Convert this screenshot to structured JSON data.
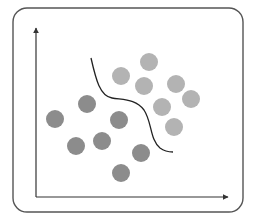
{
  "diagram": {
    "type": "classification-scatter-with-decision-boundary",
    "frame": {
      "x": 13,
      "y": 8,
      "width": 230,
      "height": 204,
      "radius": 14,
      "stroke": "#555555"
    },
    "axes": {
      "origin": {
        "x": 36,
        "y": 197
      },
      "y_axis_top": {
        "x": 36,
        "y": 28
      },
      "x_axis_right": {
        "x": 228,
        "y": 197
      },
      "color": "#333333"
    },
    "classes": [
      {
        "name": "class-a",
        "color": "#8c8c8c",
        "points": [
          {
            "x": 55,
            "y": 119
          },
          {
            "x": 87,
            "y": 104
          },
          {
            "x": 119,
            "y": 120
          },
          {
            "x": 76,
            "y": 146
          },
          {
            "x": 102,
            "y": 141
          },
          {
            "x": 141,
            "y": 153
          },
          {
            "x": 121,
            "y": 173
          }
        ]
      },
      {
        "name": "class-b",
        "color": "#b3b3b3",
        "points": [
          {
            "x": 149,
            "y": 62
          },
          {
            "x": 121,
            "y": 76
          },
          {
            "x": 144,
            "y": 86
          },
          {
            "x": 176,
            "y": 84
          },
          {
            "x": 191,
            "y": 99
          },
          {
            "x": 162,
            "y": 107
          },
          {
            "x": 174,
            "y": 127
          }
        ]
      }
    ],
    "point_radius": 9,
    "boundary": {
      "path": "M 91 58 C 96 80, 100 96, 112 98 C 124 100, 136 99, 144 110 C 152 122, 150 140, 160 148 C 164 151, 168 152, 173 152",
      "color": "#222222"
    }
  }
}
